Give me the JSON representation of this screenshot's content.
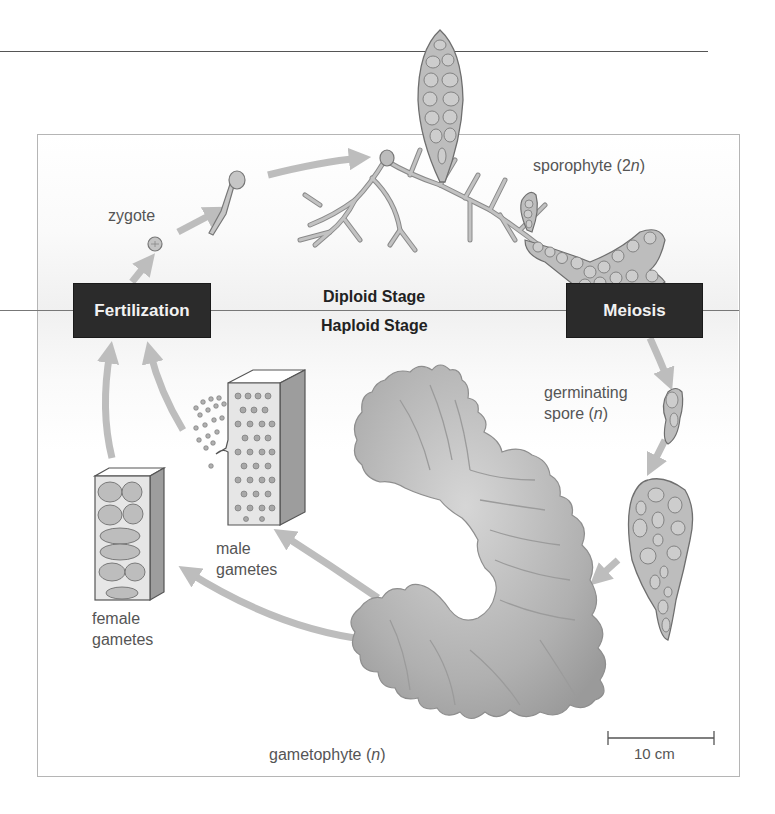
{
  "diagram": {
    "type": "life-cycle",
    "stages": {
      "diploid_label": "Diploid Stage",
      "haploid_label": "Haploid Stage"
    },
    "events": {
      "fertilization": "Fertilization",
      "meiosis": "Meiosis"
    },
    "labels": {
      "zygote": "zygote",
      "sporophyte_prefix": "sporophyte (",
      "sporophyte_ploidy_num": "2",
      "sporophyte_ploidy_var": "n",
      "sporophyte_suffix": ")",
      "germinating_line1": "germinating",
      "spore_prefix": "spore (",
      "spore_ploidy_var": "n",
      "spore_suffix": ")",
      "male_line1": "male",
      "male_line2": "gametes",
      "female_line1": "female",
      "female_line2": "gametes",
      "gametophyte_prefix": "gametophyte (",
      "gametophyte_ploidy_var": "n",
      "gametophyte_suffix": ")"
    },
    "scale_bar": {
      "label": "10 cm"
    },
    "cycle_sequence": [
      "Fertilization",
      "zygote",
      "sporophyte (2n)",
      "Meiosis",
      "germinating spore (n)",
      "gametophyte (n)",
      "male gametes",
      "female gametes",
      "Fertilization"
    ],
    "colors": {
      "event_box": "#2b2b2b",
      "event_text": "#f2f2f2",
      "arrow": "#bdbdbd",
      "organism_fill": "#b9b9b9",
      "organism_stroke": "#6f6f6f",
      "frame": "#b5b5b5"
    }
  }
}
